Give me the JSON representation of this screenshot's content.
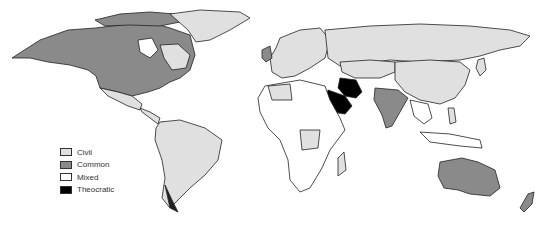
{
  "legend": {
    "items": [
      {
        "label": "Civil",
        "color": "#e0e0e0"
      },
      {
        "label": "Common",
        "color": "#8a8a8a"
      },
      {
        "label": "Mixed",
        "color": "#ffffff"
      },
      {
        "label": "Theocratic",
        "color": "#000000"
      }
    ]
  },
  "colors": {
    "civil": "#e0e0e0",
    "common": "#8a8a8a",
    "mixed": "#ffffff",
    "theocratic": "#000000",
    "border": "#222222"
  }
}
